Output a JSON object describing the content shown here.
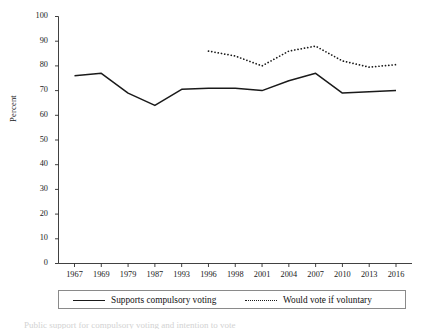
{
  "chart_data": {
    "type": "line",
    "title": "",
    "subtitle": "",
    "xlabel": "",
    "ylabel": "Percent",
    "categories": [
      "1967",
      "1969",
      "1979",
      "1987",
      "1993",
      "1996",
      "1998",
      "2001",
      "2004",
      "2007",
      "2010",
      "2013",
      "2016"
    ],
    "ylim": [
      0,
      100
    ],
    "yticks": [
      "0",
      "10",
      "20",
      "30",
      "40",
      "50",
      "60",
      "70",
      "80",
      "90",
      "100"
    ],
    "grid": false,
    "legend_position": "bottom",
    "series": [
      {
        "name": "Supports compulsory voting",
        "style": "solid",
        "color": "#1a1a1a",
        "values": [
          76,
          77,
          69,
          64,
          70.5,
          71,
          71,
          70,
          74,
          77,
          69,
          69.5,
          70
        ]
      },
      {
        "name": "Would vote if voluntary",
        "style": "dotted",
        "color": "#1a1a1a",
        "values": [
          null,
          null,
          null,
          null,
          null,
          86,
          84,
          80,
          86,
          88,
          82,
          79.5,
          80.5
        ]
      }
    ]
  },
  "axes": {
    "y_axis_label": "Percent"
  },
  "legend": {
    "entries": [
      {
        "label": "Supports compulsory voting",
        "style": "solid"
      },
      {
        "label": "Would vote if voluntary",
        "style": "dotted"
      }
    ]
  },
  "caption": {
    "text": "Public support for compulsory voting and intention to vote"
  }
}
